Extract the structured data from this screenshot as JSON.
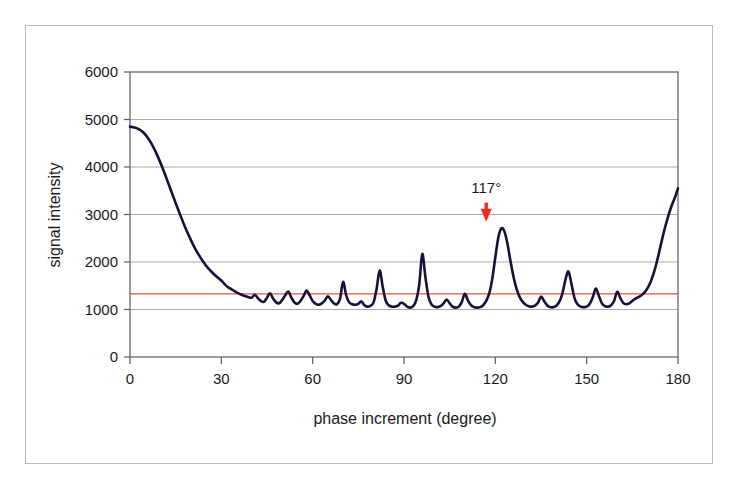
{
  "chart_data": {
    "type": "line",
    "title": "",
    "xlabel": "phase increment (degree)",
    "ylabel": "signal intensity",
    "xlim": [
      0,
      180
    ],
    "ylim": [
      0,
      6000
    ],
    "xticks": [
      0,
      30,
      60,
      90,
      120,
      150,
      180
    ],
    "yticks": [
      0,
      1000,
      2000,
      3000,
      4000,
      5000,
      6000
    ],
    "xtick_labels": [
      "0",
      "30",
      "60",
      "90",
      "120",
      "150",
      "180"
    ],
    "ytick_labels": [
      "0",
      "1000",
      "2000",
      "3000",
      "4000",
      "5000",
      "6000"
    ],
    "grid": true,
    "grid_axis": "y",
    "legend": false,
    "legend_position": "none",
    "series": [
      {
        "name": "signal intensity",
        "color": "#12123a",
        "line_width": 2.6,
        "x": [
          0,
          1.5,
          3,
          4.5,
          6,
          7.5,
          9,
          10.5,
          12,
          13.5,
          15,
          16.5,
          18,
          19.5,
          21,
          22.5,
          24,
          25.5,
          27,
          28.5,
          30,
          31,
          32,
          33,
          34,
          35,
          36,
          37,
          38,
          39,
          40,
          41,
          42,
          43,
          44,
          45,
          46,
          47,
          48,
          49,
          50,
          51,
          52,
          53,
          54,
          55,
          56,
          57,
          58,
          59,
          60,
          61,
          62,
          63,
          64,
          65,
          66,
          67,
          68,
          69,
          70,
          71,
          72,
          73,
          74,
          75,
          76,
          77,
          78,
          79,
          80,
          81,
          82,
          83,
          84,
          85,
          86,
          87,
          88,
          89,
          90,
          91,
          92,
          93,
          94,
          95,
          96,
          97,
          98,
          99,
          100,
          101,
          102,
          103,
          104,
          105,
          106,
          107,
          108,
          109,
          110,
          111,
          112,
          113,
          114,
          115,
          116,
          117,
          118,
          119,
          120,
          121,
          122,
          123,
          124,
          125,
          126,
          127,
          128,
          129,
          130,
          131,
          132,
          133,
          134,
          135,
          136,
          137,
          138,
          139,
          140,
          141,
          142,
          143,
          144,
          145,
          146,
          147,
          148,
          149,
          150,
          151,
          152,
          153,
          154,
          155,
          156,
          157,
          158,
          159,
          160,
          161,
          162,
          163,
          164,
          165,
          166,
          167,
          168,
          169,
          170,
          171,
          172,
          173,
          174,
          175,
          176,
          177,
          178,
          179,
          180
        ],
        "y": [
          4850,
          4830,
          4790,
          4720,
          4600,
          4440,
          4240,
          4010,
          3760,
          3500,
          3240,
          2990,
          2750,
          2530,
          2330,
          2160,
          2010,
          1880,
          1780,
          1690,
          1610,
          1540,
          1480,
          1440,
          1400,
          1360,
          1330,
          1300,
          1280,
          1260,
          1250,
          1310,
          1240,
          1180,
          1160,
          1250,
          1340,
          1230,
          1150,
          1130,
          1200,
          1300,
          1380,
          1250,
          1150,
          1120,
          1180,
          1280,
          1400,
          1300,
          1180,
          1120,
          1100,
          1130,
          1190,
          1280,
          1200,
          1130,
          1110,
          1230,
          1580,
          1300,
          1150,
          1110,
          1100,
          1120,
          1170,
          1090,
          1060,
          1080,
          1150,
          1430,
          1820,
          1480,
          1180,
          1090,
          1060,
          1060,
          1080,
          1140,
          1120,
          1060,
          1040,
          1070,
          1190,
          1520,
          2170,
          1700,
          1280,
          1110,
          1060,
          1050,
          1070,
          1130,
          1210,
          1130,
          1060,
          1040,
          1060,
          1160,
          1330,
          1190,
          1090,
          1050,
          1040,
          1050,
          1090,
          1180,
          1340,
          1650,
          2100,
          2520,
          2710,
          2640,
          2380,
          2010,
          1680,
          1430,
          1260,
          1160,
          1100,
          1070,
          1060,
          1080,
          1140,
          1270,
          1180,
          1090,
          1050,
          1050,
          1080,
          1160,
          1330,
          1620,
          1800,
          1540,
          1240,
          1110,
          1060,
          1050,
          1060,
          1120,
          1260,
          1440,
          1290,
          1130,
          1070,
          1060,
          1090,
          1180,
          1370,
          1250,
          1140,
          1110,
          1130,
          1180,
          1230,
          1260,
          1300,
          1360,
          1450,
          1580,
          1760,
          1990,
          2260,
          2540,
          2790,
          3010,
          3200,
          3360,
          3550
        ]
      }
    ],
    "threshold_line": {
      "name": "threshold",
      "value": 1330,
      "color": "#e8543f",
      "orientation": "horizontal"
    },
    "annotations": [
      {
        "name": "peak-marker",
        "text": "117°",
        "x": 117,
        "y": 2700,
        "label_y": 3450,
        "arrow_from_y": 3250,
        "arrow_to_y": 2850,
        "color": "#ee2c1e"
      }
    ]
  },
  "axes": {
    "x_title": "phase increment (degree)",
    "y_title": "signal intensity"
  },
  "colors": {
    "curve": "#12123a",
    "threshold": "#e8543f",
    "arrow": "#ee2c1e",
    "grid": "#aaaaaa",
    "frame": "#5a5a5a",
    "outer_border": "#b9b9b9",
    "background": "#ffffff"
  }
}
